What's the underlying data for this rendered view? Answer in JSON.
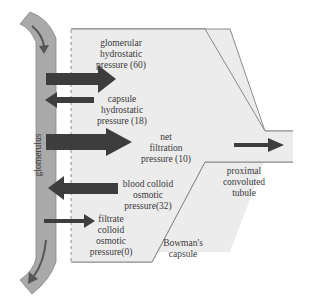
{
  "colors": {
    "capsule_fill": "#ececec",
    "capsule_stroke": "#8a8a8a",
    "tube_fill": "#a9a9a9",
    "tube_stroke": "#888888",
    "arrow": "#3d3d3d",
    "text": "#3a3a3a"
  },
  "labels": {
    "glomerulus": "glomerulus",
    "glomerular_hydrostatic": [
      "glomerular",
      "hydrostatic",
      "pressure (60)"
    ],
    "capsule_hydrostatic": [
      "capsule",
      "hydrostatic",
      "pressure (18)"
    ],
    "net_filtration": [
      "net",
      "filtration",
      "pressure (10)"
    ],
    "blood_colloid": [
      "blood colloid",
      "osmotic",
      "pressure(32)"
    ],
    "filtrate_colloid": [
      "filtrate",
      "colloid",
      "osmotic",
      "pressure(0)"
    ],
    "bowmans_capsule": [
      "Bowman's",
      "capsule"
    ],
    "proximal_tubule": [
      "proximal",
      "convoluted",
      "tubule"
    ]
  },
  "pressures": {
    "glomerular_hydrostatic": 60,
    "capsule_hydrostatic": 18,
    "net_filtration": 10,
    "blood_colloid_osmotic": 32,
    "filtrate_colloid_osmotic": 0
  }
}
